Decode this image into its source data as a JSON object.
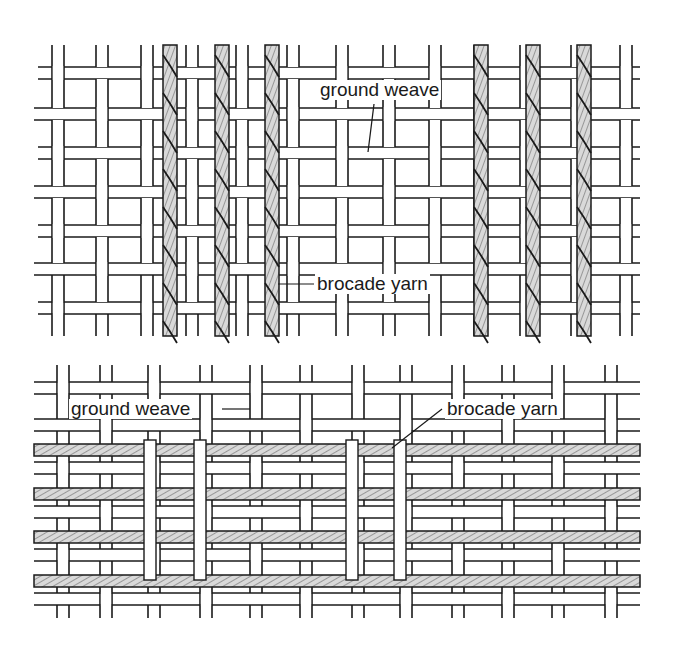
{
  "figure": {
    "top": {
      "caption": "Vertical (warp) brocade yarns over a plain ground weave",
      "labels": {
        "ground_weave": "ground weave",
        "brocade_yarn": "brocade yarn"
      },
      "brocade_orientation": "vertical",
      "brocade_yarn_count": 6
    },
    "bottom": {
      "caption": "Horizontal (weft) brocade yarns over a plain ground weave",
      "labels": {
        "ground_weave": "ground weave",
        "brocade_yarn": "brocade yarn"
      },
      "brocade_orientation": "horizontal",
      "brocade_yarn_count": 4
    }
  },
  "colors": {
    "line": "#1a1a1a",
    "background": "#ffffff",
    "brocade_fill": "#d9d9d9"
  }
}
